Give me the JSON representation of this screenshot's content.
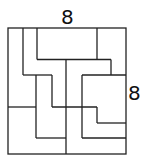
{
  "diagram": {
    "type": "dissection-puzzle",
    "colors": {
      "stroke": "#222222",
      "background": "#ffffff",
      "text": "#111111"
    },
    "labels": {
      "top": "8",
      "right": "8"
    },
    "outer_square": {
      "x": 8,
      "y": 28,
      "width": 118,
      "height": 126
    },
    "segments": [
      [
        23,
        28,
        23,
        75
      ],
      [
        23,
        75,
        52,
        75
      ],
      [
        37,
        28,
        37,
        59.5
      ],
      [
        37,
        59.5,
        111,
        59.5
      ],
      [
        97,
        28,
        97,
        59.5
      ],
      [
        111,
        59.5,
        111,
        75
      ],
      [
        36,
        75,
        36,
        138
      ],
      [
        8,
        107,
        36,
        107
      ],
      [
        52,
        75,
        52,
        107
      ],
      [
        52,
        107,
        97,
        107
      ],
      [
        66,
        59.5,
        66,
        154
      ],
      [
        36,
        138,
        66,
        138
      ],
      [
        82,
        75,
        126,
        75
      ],
      [
        82,
        75,
        82,
        138
      ],
      [
        82,
        138,
        126,
        138
      ],
      [
        97,
        107,
        97,
        123
      ],
      [
        97,
        123,
        126,
        123
      ]
    ]
  }
}
